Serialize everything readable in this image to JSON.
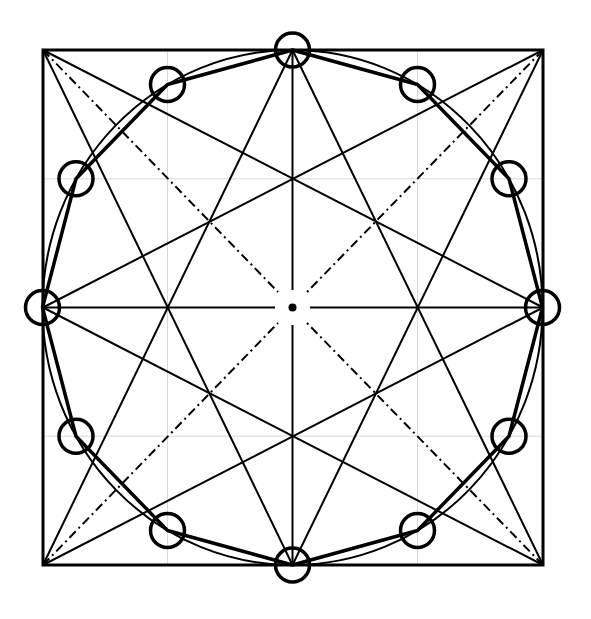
{
  "diagram": {
    "canvas": {
      "width": 591,
      "height": 619,
      "background": "#ffffff"
    },
    "colors": {
      "ink": "#000000",
      "grid": "#d8d8d8"
    },
    "square": {
      "left": 43,
      "top": 50,
      "right": 543,
      "bottom": 565
    },
    "center": {
      "x": 292.5,
      "y": 307.5,
      "dot_radius": 4
    },
    "ellipse": {
      "cx": 292.5,
      "cy": 307.5,
      "rx": 250,
      "ry": 257.5
    },
    "grid_lines": {
      "vertical": [
        167.5,
        417.5
      ],
      "horizontal": [
        178.8,
        436.2
      ]
    },
    "vertex_markers": {
      "radius": 17,
      "points": [
        [
          542.5,
          307.5
        ],
        [
          509,
          178.8
        ],
        [
          417.5,
          84.5
        ],
        [
          292.5,
          50
        ],
        [
          167.5,
          84.5
        ],
        [
          76,
          178.8
        ],
        [
          42.5,
          307.5
        ],
        [
          76,
          436.2
        ],
        [
          167.5,
          530.5
        ],
        [
          292.5,
          565
        ],
        [
          417.5,
          530.5
        ],
        [
          509,
          436.2
        ]
      ]
    },
    "star_lines": [
      [
        [
          43,
          50
        ],
        [
          292.5,
          565
        ]
      ],
      [
        [
          43,
          50
        ],
        [
          543,
          307.5
        ]
      ],
      [
        [
          543,
          50
        ],
        [
          292.5,
          565
        ]
      ],
      [
        [
          543,
          50
        ],
        [
          43,
          307.5
        ]
      ],
      [
        [
          43,
          565
        ],
        [
          292.5,
          50
        ]
      ],
      [
        [
          43,
          565
        ],
        [
          543,
          307.5
        ]
      ],
      [
        [
          543,
          565
        ],
        [
          292.5,
          50
        ]
      ],
      [
        [
          543,
          565
        ],
        [
          43,
          307.5
        ]
      ]
    ],
    "diagonals_dashdot": [
      [
        [
          43,
          50
        ],
        [
          278,
          292
        ]
      ],
      [
        [
          543,
          50
        ],
        [
          307,
          292
        ]
      ],
      [
        [
          43,
          565
        ],
        [
          278,
          323
        ]
      ],
      [
        [
          543,
          565
        ],
        [
          307,
          323
        ]
      ]
    ],
    "midlines": [
      [
        [
          292.5,
          50
        ],
        [
          292.5,
          290
        ]
      ],
      [
        [
          292.5,
          325
        ],
        [
          292.5,
          565
        ]
      ],
      [
        [
          43,
          307.5
        ],
        [
          275,
          307.5
        ]
      ],
      [
        [
          310,
          307.5
        ],
        [
          543,
          307.5
        ]
      ]
    ]
  }
}
